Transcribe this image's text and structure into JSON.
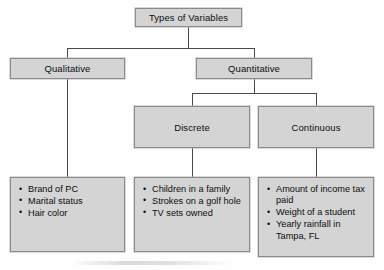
{
  "diagram": {
    "title": "Types of Variables",
    "palette": {
      "box_fill": "#d4d4d4",
      "box_border": "#8a8a8a",
      "connector": "#4a4a4a",
      "text": "#0d0d0d",
      "background": "#fefefe"
    },
    "nodes": {
      "root": {
        "label": "Types of Variables"
      },
      "qualitative": {
        "label": "Qualitative"
      },
      "quantitative": {
        "label": "Quantitative"
      },
      "discrete": {
        "label": "Discrete"
      },
      "continuous": {
        "label": "Continuous"
      }
    },
    "examples": {
      "qualitative": [
        "Brand of PC",
        "Marital status",
        "Hair color"
      ],
      "discrete": [
        "Children in a family",
        "Strokes on a golf hole",
        "TV sets owned"
      ],
      "continuous": [
        "Amount of income tax paid",
        "Weight of a student",
        "Yearly rainfall in Tampa, FL"
      ]
    }
  }
}
